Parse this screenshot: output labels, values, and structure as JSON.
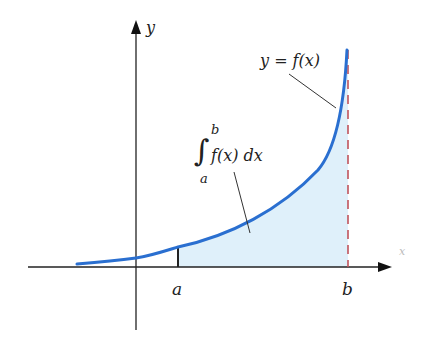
{
  "figure": {
    "type": "definite-integral-illustration",
    "labels": {
      "y_axis": "y",
      "x_axis": "x",
      "curve": "y = f(x)",
      "integral_symbol": "∫",
      "integral_upper": "b",
      "integral_lower": "a",
      "integrand": "f(x) dx",
      "a": "a",
      "b": "b"
    },
    "colors": {
      "curve": "#2a6fd0",
      "shade": "#dff0fa",
      "asymptote": "#c0545c",
      "axis": "#222222"
    }
  }
}
